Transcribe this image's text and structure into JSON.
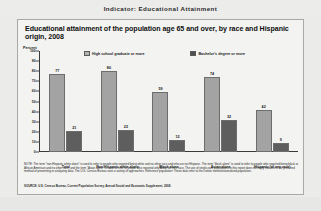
{
  "header": {
    "indicator_label": "Indicator: Educational Attainment"
  },
  "panel": {
    "title": "Educational attainment of the population age 65 and over, by race and Hispanic origin, 2008",
    "y_axis_label": "Percent",
    "legend": [
      {
        "key": "hs",
        "label": "High school graduate or more"
      },
      {
        "key": "ba",
        "label": "Bachelor's degree or more"
      }
    ],
    "note": "NOTE: The term \"non-Hispanic white alone\" is used to refer to people who reported being white and no other race and who are not Hispanic. The term \"black alone\" is used to refer to people who reported being black or African American and no other race, and the term \"Asian alone\" is used to refer to people who reported only Asian as their race. The use of single-race populations in this report does not imply that this is the preferred method of presenting or analyzing data. The U.S. Census Bureau uses a variety of approaches. Reference population: These data refer to the civilian noninstitutionalized population.",
    "source": "SOURCE: U.S. Census Bureau, Current Population Survey, Annual Social and Economic Supplement, 2008."
  },
  "chart_data": {
    "type": "bar",
    "title": "Educational attainment of the population age 65 and over, by race and Hispanic origin, 2008",
    "xlabel": "",
    "ylabel": "Percent",
    "ylim": [
      0,
      100
    ],
    "yticks": [
      0,
      10,
      20,
      30,
      40,
      50,
      60,
      70,
      80,
      90,
      100
    ],
    "grid": false,
    "legend_position": "top",
    "categories": [
      "Total",
      "Non-Hispanic white alone",
      "Black alone",
      "Asian alone",
      "Hispanic (of any race)"
    ],
    "series": [
      {
        "name": "High school graduate or more",
        "color": "#a3a3a3",
        "values": [
          77,
          80,
          59,
          74,
          42
        ]
      },
      {
        "name": "Bachelor's degree or more",
        "color": "#5e5e5e",
        "values": [
          21,
          22,
          12,
          32,
          9
        ]
      }
    ]
  }
}
